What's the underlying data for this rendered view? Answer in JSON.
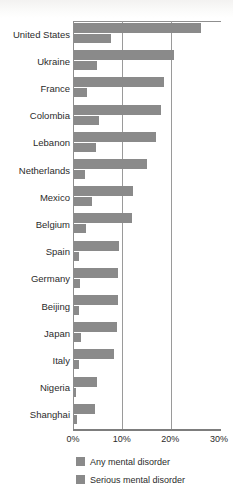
{
  "chart_data": {
    "type": "bar",
    "orientation": "horizontal",
    "title": "",
    "subtitle": "",
    "xlabel": "",
    "ylabel": "",
    "xlim": [
      0,
      30
    ],
    "xticks": [
      "0%",
      "10%",
      "20%",
      "30%"
    ],
    "xtick_values": [
      0,
      10,
      20,
      30
    ],
    "grid": "vertical",
    "legend_position": "bottom",
    "categories": [
      "United States",
      "Ukraine",
      "France",
      "Colombia",
      "Lebanon",
      "Netherlands",
      "Mexico",
      "Belgium",
      "Spain",
      "Germany",
      "Beijing",
      "Japan",
      "Italy",
      "Nigeria",
      "Shanghai"
    ],
    "series": [
      {
        "name": "Any mental disorder",
        "color": "#8a8a8a",
        "values": [
          26.0,
          20.5,
          18.4,
          17.8,
          16.9,
          14.9,
          12.2,
          12.0,
          9.2,
          9.1,
          9.1,
          8.8,
          8.2,
          4.7,
          4.3
        ]
      },
      {
        "name": "Serious mental disorder",
        "color": "#8a8a8a",
        "values": [
          7.7,
          4.8,
          2.7,
          5.2,
          4.6,
          2.3,
          3.7,
          2.4,
          1.0,
          1.2,
          1.1,
          1.5,
          1.0,
          0.4,
          0.6
        ]
      }
    ]
  },
  "legend": {
    "items": [
      {
        "label": "Any mental disorder",
        "color": "#8a8a8a"
      },
      {
        "label": "Serious mental disorder",
        "color": "#8a8a8a"
      }
    ]
  },
  "axis": {
    "x_tick_labels": [
      "0%",
      "10%",
      "20%",
      "30%"
    ]
  }
}
